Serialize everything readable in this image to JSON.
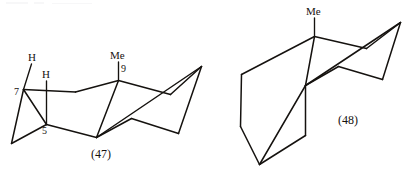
{
  "page": {
    "background_color": "#ffffff",
    "ink_color": "#15120f",
    "width": 418,
    "height": 172
  },
  "figure": {
    "kind": "chemical-structure-pair",
    "structures": [
      {
        "id": "structure-47",
        "caption": "(47)",
        "labels": {
          "methyl": "Me",
          "methyl_position": "9",
          "ring_position_5": "5",
          "ring_position_7": "7",
          "axial_hydrogen": "H",
          "equatorial_hydrogen": "H"
        }
      },
      {
        "id": "structure-48",
        "caption": "(48)",
        "labels": {
          "methyl": "Me"
        }
      }
    ]
  },
  "captions": {
    "left": "(47)",
    "right": "(48)"
  },
  "left_structure": {
    "methyl_label": "Me",
    "carbon_9_label": "9",
    "carbon_7_label": "7",
    "carbon_5_label": "5",
    "hydrogen_upper_label": "H",
    "hydrogen_lower_label": "H"
  },
  "right_structure": {
    "methyl_label": "Me"
  }
}
